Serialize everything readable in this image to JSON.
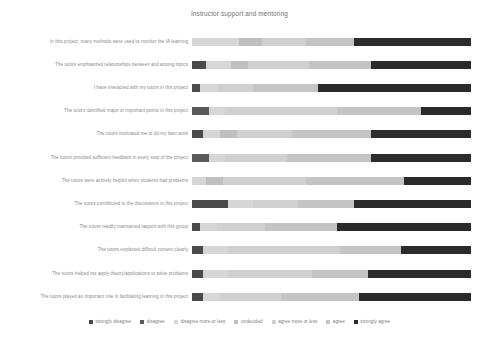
{
  "chart_data": {
    "type": "bar",
    "subtype": "stacked-horizontal-likert",
    "title": "Instructor support and mentoring",
    "xlabel": "",
    "ylabel": "",
    "xlim": [
      0,
      100
    ],
    "grid": false,
    "legend_position": "bottom",
    "units": "percent",
    "categories": [
      "In this project, many methods were used to monitor the IA learning",
      "The tutors emphasized relationships between and among topics",
      "I have interacted with my tutors in this project",
      "The tutors identified major or important points in this project",
      "The tutors motivated me to do my best work",
      "The tutors provided sufficient feedback in every step of the project",
      "The tutors were actively helpful when students had problems",
      "The tutors contributed to the discussions in this project",
      "The tutors readily maintained rapport with this group",
      "The tutors explained difficult content clearly",
      "The tutors helped me apply theory/applications to solve problems",
      "The tutors played an important role in facilitating learning in this project"
    ],
    "series": [
      {
        "name": "strongly disagree",
        "color": "#4a4a4a",
        "values": [
          0,
          5,
          3,
          0,
          4,
          0,
          0,
          13,
          3,
          4,
          4,
          4
        ]
      },
      {
        "name": "disagree",
        "color": "#595959",
        "values": [
          0,
          0,
          0,
          6,
          0,
          6,
          0,
          0,
          0,
          0,
          0,
          0
        ]
      },
      {
        "name": "disagree more or less",
        "color": "#d6d6d6",
        "values": [
          17,
          9,
          6,
          6,
          6,
          6,
          5,
          9,
          6,
          9,
          9,
          6
        ]
      },
      {
        "name": "undecided",
        "color": "#bfbfbf",
        "values": [
          8,
          6,
          0,
          0,
          6,
          0,
          6,
          0,
          0,
          0,
          0,
          0
        ]
      },
      {
        "name": "agree more or less",
        "color": "#d0d0d0",
        "values": [
          16,
          22,
          13,
          40,
          20,
          22,
          30,
          16,
          17,
          40,
          30,
          22
        ]
      },
      {
        "name": "agree",
        "color": "#c4c4c4",
        "values": [
          17,
          22,
          23,
          30,
          28,
          30,
          35,
          20,
          26,
          22,
          20,
          28
        ]
      },
      {
        "name": "strongly agree",
        "color": "#2b2b2b",
        "values": [
          42,
          36,
          55,
          18,
          36,
          36,
          24,
          42,
          48,
          25,
          37,
          40
        ]
      }
    ]
  },
  "legend": {
    "items": [
      {
        "label": "strongly disagree"
      },
      {
        "label": "disagree"
      },
      {
        "label": "disagree more or less"
      },
      {
        "label": "undecided"
      },
      {
        "label": "agree more or less"
      },
      {
        "label": "agree"
      },
      {
        "label": "strongly agree"
      }
    ]
  }
}
